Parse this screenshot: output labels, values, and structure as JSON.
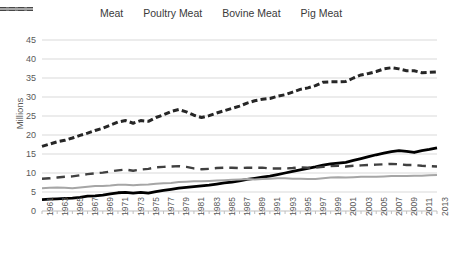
{
  "chart_data": {
    "type": "line",
    "title": "",
    "xlabel": "",
    "ylabel": "Millions",
    "ylim": [
      0,
      45
    ],
    "ytick_values": [
      0,
      5,
      10,
      15,
      20,
      25,
      30,
      35,
      40,
      45
    ],
    "ytick_labels": [
      "0",
      "5",
      "10",
      "15",
      "20",
      "25",
      "30",
      "35",
      "40",
      "45"
    ],
    "grid": true,
    "legend_position": "top",
    "x": [
      1961,
      1962,
      1963,
      1964,
      1965,
      1966,
      1967,
      1968,
      1969,
      1970,
      1971,
      1972,
      1973,
      1974,
      1975,
      1976,
      1977,
      1978,
      1979,
      1980,
      1981,
      1982,
      1983,
      1984,
      1985,
      1986,
      1987,
      1988,
      1989,
      1990,
      1991,
      1992,
      1993,
      1994,
      1995,
      1996,
      1997,
      1998,
      1999,
      2000,
      2001,
      2002,
      2003,
      2004,
      2005,
      2006,
      2007,
      2008,
      2009,
      2010,
      2011,
      2012,
      2013
    ],
    "xtick_labels": [
      "1961",
      "1963",
      "1965",
      "1967",
      "1969",
      "1971",
      "1973",
      "1975",
      "1977",
      "1979",
      "1981",
      "1983",
      "1985",
      "1987",
      "1989",
      "1991",
      "1993",
      "1995",
      "1997",
      "1999",
      "2001",
      "2003",
      "2005",
      "2007",
      "2009",
      "2011",
      "2013"
    ],
    "series": [
      {
        "name": "Meat",
        "style": "dashed-thick",
        "color": "#262626",
        "values": [
          17.0,
          17.6,
          18.2,
          18.6,
          19.2,
          19.9,
          20.5,
          21.2,
          21.8,
          22.6,
          23.4,
          23.8,
          23.1,
          23.8,
          23.6,
          24.6,
          25.3,
          26.2,
          26.7,
          26.1,
          25.2,
          24.6,
          25.1,
          25.8,
          26.4,
          27.0,
          27.6,
          28.4,
          29.0,
          29.4,
          29.6,
          30.2,
          30.6,
          31.3,
          32.0,
          32.4,
          33.0,
          33.9,
          34.0,
          34.0,
          34.1,
          35.0,
          35.8,
          36.2,
          36.7,
          37.4,
          37.7,
          37.4,
          36.9,
          36.9,
          36.4,
          36.5,
          36.6
        ]
      },
      {
        "name": "Poultry Meat",
        "style": "solid-thick",
        "color": "#000000",
        "values": [
          3.0,
          3.1,
          3.2,
          3.3,
          3.4,
          3.6,
          3.9,
          4.0,
          4.2,
          4.5,
          4.8,
          4.9,
          4.7,
          4.9,
          4.7,
          5.1,
          5.4,
          5.7,
          6.0,
          6.2,
          6.4,
          6.6,
          6.8,
          7.1,
          7.4,
          7.6,
          7.9,
          8.3,
          8.6,
          8.9,
          9.2,
          9.6,
          10.0,
          10.4,
          10.8,
          11.2,
          11.6,
          12.1,
          12.4,
          12.6,
          12.8,
          13.3,
          13.8,
          14.3,
          14.8,
          15.2,
          15.6,
          15.9,
          15.7,
          15.4,
          15.9,
          16.2,
          16.6
        ]
      },
      {
        "name": "Bovine Meat",
        "style": "dashed-medium",
        "color": "#404040",
        "values": [
          8.5,
          8.6,
          8.8,
          9.0,
          9.1,
          9.4,
          9.7,
          9.9,
          10.1,
          10.4,
          10.7,
          10.9,
          10.6,
          10.9,
          11.1,
          11.5,
          11.6,
          11.7,
          11.8,
          11.6,
          11.2,
          11.0,
          11.1,
          11.3,
          11.4,
          11.4,
          11.3,
          11.4,
          11.4,
          11.4,
          11.2,
          11.2,
          11.2,
          11.3,
          11.5,
          11.4,
          11.4,
          11.6,
          11.8,
          11.9,
          11.7,
          11.9,
          12.0,
          12.1,
          12.2,
          12.3,
          12.4,
          12.3,
          12.1,
          12.1,
          11.9,
          11.8,
          11.7
        ]
      },
      {
        "name": "Pig Meat",
        "style": "solid-thin",
        "color": "#a6a6a6",
        "values": [
          6.0,
          6.1,
          6.2,
          6.1,
          6.0,
          6.2,
          6.4,
          6.6,
          6.6,
          6.7,
          6.9,
          6.9,
          6.8,
          6.9,
          7.0,
          7.2,
          7.3,
          7.4,
          7.6,
          7.7,
          7.8,
          7.8,
          7.9,
          8.0,
          8.1,
          8.2,
          8.3,
          8.4,
          8.3,
          8.4,
          8.5,
          8.6,
          8.6,
          8.5,
          8.5,
          8.4,
          8.4,
          8.6,
          8.8,
          8.9,
          8.8,
          8.9,
          9.0,
          9.0,
          9.0,
          9.1,
          9.2,
          9.2,
          9.2,
          9.3,
          9.3,
          9.4,
          9.5
        ]
      }
    ]
  },
  "legend": {
    "items": [
      {
        "label": "Meat"
      },
      {
        "label": "Poultry Meat"
      },
      {
        "label": "Bovine Meat"
      },
      {
        "label": "Pig Meat"
      }
    ]
  }
}
